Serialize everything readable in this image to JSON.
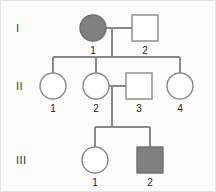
{
  "figure": {
    "kind": "pedigree-chart",
    "background_color": "#fcfcfc",
    "line_color": "#8a8a8a",
    "affected_fill": "#808080",
    "unaffected_fill": "#ffffff",
    "frame_color": "#e3e3e3"
  },
  "generations": [
    {
      "label": "I",
      "y": 28
    },
    {
      "label": "II",
      "y": 86
    },
    {
      "label": "III",
      "y": 160
    }
  ],
  "individuals": [
    {
      "id": "I-1",
      "generation": "I",
      "number": "1",
      "sex": "female",
      "shape": "circle",
      "affected": true,
      "fill": "#808080",
      "cx": 93,
      "cy": 28,
      "r": 13,
      "label_x": 93,
      "label_y": 54
    },
    {
      "id": "I-2",
      "generation": "I",
      "number": "2",
      "sex": "male",
      "shape": "square",
      "affected": false,
      "fill": "#ffffff",
      "x": 132,
      "y": 15,
      "size": 26,
      "label_x": 145,
      "label_y": 54
    },
    {
      "id": "II-1",
      "generation": "II",
      "number": "1",
      "sex": "female",
      "shape": "circle",
      "affected": false,
      "fill": "#ffffff",
      "cx": 53,
      "cy": 86,
      "r": 13,
      "label_x": 53,
      "label_y": 112
    },
    {
      "id": "II-2",
      "generation": "II",
      "number": "2",
      "sex": "female",
      "shape": "circle",
      "affected": false,
      "fill": "#ffffff",
      "cx": 96,
      "cy": 86,
      "r": 13,
      "label_x": 96,
      "label_y": 112
    },
    {
      "id": "II-3",
      "generation": "II",
      "number": "3",
      "sex": "male",
      "shape": "square",
      "affected": false,
      "fill": "#ffffff",
      "x": 126,
      "y": 73,
      "size": 26,
      "label_x": 139,
      "label_y": 112
    },
    {
      "id": "II-4",
      "generation": "II",
      "number": "4",
      "sex": "female",
      "shape": "circle",
      "affected": false,
      "fill": "#ffffff",
      "cx": 180,
      "cy": 86,
      "r": 13,
      "label_x": 180,
      "label_y": 112
    },
    {
      "id": "III-1",
      "generation": "III",
      "number": "1",
      "sex": "female",
      "shape": "circle",
      "affected": false,
      "fill": "#ffffff",
      "cx": 95,
      "cy": 160,
      "r": 13,
      "label_x": 95,
      "label_y": 186
    },
    {
      "id": "III-2",
      "generation": "III",
      "number": "2",
      "sex": "male",
      "shape": "square",
      "affected": true,
      "fill": "#808080",
      "x": 137,
      "y": 147,
      "size": 26,
      "label_x": 150,
      "label_y": 186
    }
  ],
  "connections": {
    "mating_I": {
      "from_x": 106,
      "to_x": 132,
      "y": 28
    },
    "descent_I": {
      "x": 112,
      "from_y": 28,
      "to_y": 57
    },
    "sibship_II": {
      "from_x": 53,
      "to_x": 180,
      "y": 57
    },
    "drops_II": [
      {
        "x": 53,
        "from_y": 57,
        "to_y": 73
      },
      {
        "x": 96,
        "from_y": 57,
        "to_y": 73
      },
      {
        "x": 180,
        "from_y": 57,
        "to_y": 73
      }
    ],
    "mating_II": {
      "from_x": 109,
      "to_x": 126,
      "y": 86
    },
    "descent_II": {
      "x": 112,
      "from_y": 86,
      "to_y": 127
    },
    "sibship_III": {
      "from_x": 95,
      "to_x": 150,
      "y": 127
    },
    "drops_III": [
      {
        "x": 95,
        "from_y": 127,
        "to_y": 147
      },
      {
        "x": 150,
        "from_y": 127,
        "to_y": 147
      }
    ]
  }
}
